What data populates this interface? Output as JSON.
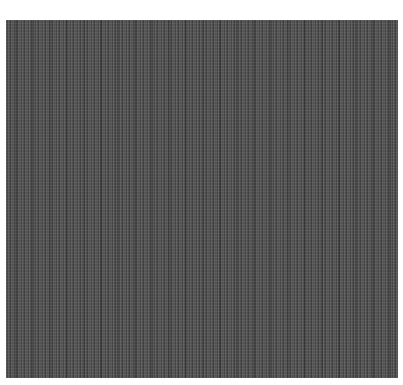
{
  "image": {
    "description": "Gray vertical-striped texture swatch on white background",
    "colors": {
      "background": "#ffffff",
      "texture_base": "#8e8e8e",
      "stripe_light": "#a8a8a8",
      "stripe_dark": "#6e6e6e"
    }
  }
}
